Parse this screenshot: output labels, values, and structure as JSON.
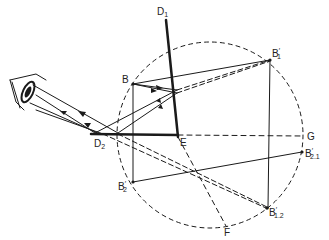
{
  "diagram": {
    "type": "optics-ray-diagram",
    "colors": {
      "ink": "#1a1a1a",
      "background": "#ffffff"
    },
    "labels": {
      "D1": {
        "main": "D",
        "sub": "1"
      },
      "B": {
        "main": "B",
        "sub": ""
      },
      "B1p": {
        "main": "B",
        "sub": "1",
        "prime": "′"
      },
      "E": {
        "main": "E",
        "sub": ""
      },
      "D2": {
        "main": "D",
        "sub": "2"
      },
      "G": {
        "main": "G",
        "sub": ""
      },
      "B21p": {
        "main": "B",
        "sub": "2.1",
        "prime": "′"
      },
      "B2p": {
        "main": "B",
        "sub": "2",
        "prime": "′"
      },
      "B12p": {
        "main": "B",
        "sub": "1.2",
        "prime": "′"
      },
      "F": {
        "main": "F",
        "sub": ""
      }
    },
    "circle": {
      "center": [
        210,
        135
      ],
      "radius": 93,
      "style": "dashed"
    },
    "observer": "eye-icon"
  }
}
